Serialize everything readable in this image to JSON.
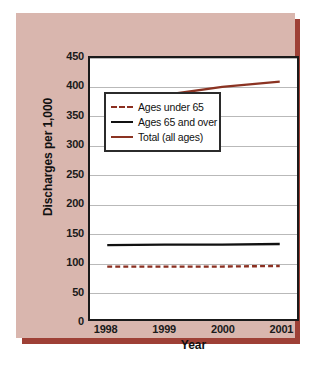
{
  "figure": {
    "panel_color": "#d9b6ae",
    "shadow_color": "#9e4036",
    "plot_background": "#ffffff",
    "frame_color": "#1a1a1a"
  },
  "chart_data": {
    "type": "line",
    "title": "",
    "xlabel": "Year",
    "ylabel": "Discharges per 1,000",
    "x": [
      1998,
      1999,
      2000,
      2001
    ],
    "xticklabels": [
      "1998",
      "1999",
      "2000",
      "2001"
    ],
    "xlim": [
      1997.7,
      2001.3
    ],
    "ylim": [
      0,
      450
    ],
    "yticks": [
      0,
      50,
      100,
      150,
      200,
      250,
      300,
      350,
      400,
      450
    ],
    "yticklabels": [
      "0",
      "50",
      "100",
      "150",
      "200",
      "250",
      "300",
      "350",
      "400",
      "450"
    ],
    "grid": "horizontal",
    "legend_position": "center",
    "series": [
      {
        "name": "Ages under 65",
        "values": [
          89,
          89,
          89,
          90
        ],
        "color": "#8b2f20",
        "style": "dashed"
      },
      {
        "name": "Ages 65 and over",
        "values": [
          126,
          127,
          127,
          128
        ],
        "color": "#111111",
        "style": "solid"
      },
      {
        "name": "Total (all ages)",
        "values": [
          382,
          386,
          400,
          409
        ],
        "color": "#8b3322",
        "style": "solid"
      }
    ]
  },
  "legend": {
    "items": [
      {
        "label": "Ages under 65"
      },
      {
        "label": "Ages 65 and over"
      },
      {
        "label": "Total (all ages)"
      }
    ]
  },
  "caption": {
    "text": ""
  }
}
